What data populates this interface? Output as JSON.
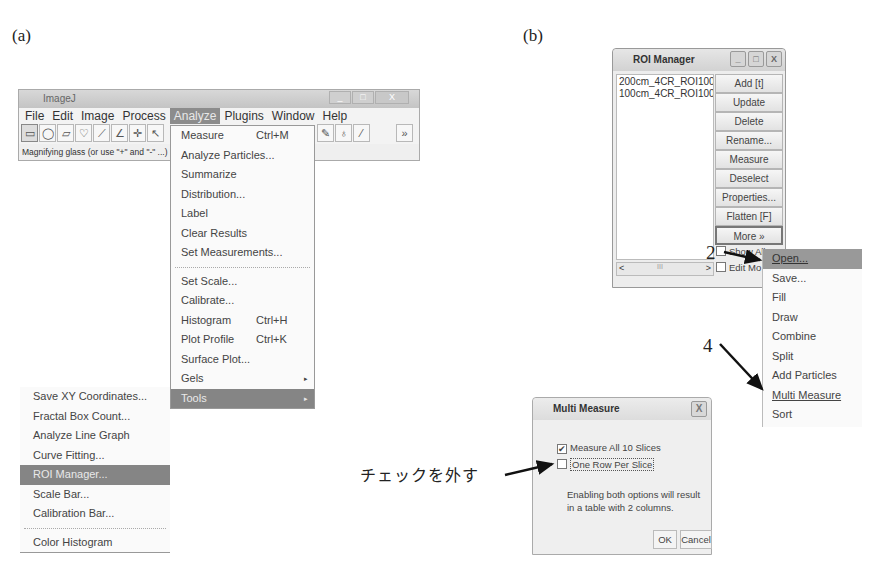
{
  "panels": {
    "a": "(a)",
    "b": "(b)"
  },
  "imagej": {
    "title": "ImageJ",
    "window_controls": [
      "_",
      "□",
      "X"
    ],
    "menubar": [
      "File",
      "Edit",
      "Image",
      "Process",
      "Analyze",
      "Plugins",
      "Window",
      "Help"
    ],
    "active_menu": "Analyze",
    "tools": [
      "rectangle-icon",
      "oval-icon",
      "polygon-icon",
      "freehand-icon",
      "line-icon",
      "angle-icon",
      "point-icon",
      "wand-icon",
      "text-icon",
      "magnifier-icon",
      "hand-icon",
      "dropper-icon",
      "brush-icon",
      "flood-icon",
      "pick-icon",
      "blank",
      "more-icon"
    ],
    "more_tools_label": "»",
    "status": "Magnifying glass (or use \"+\" and \"-\" ...)"
  },
  "analyze_menu": {
    "group1": [
      {
        "label": "Measure",
        "shortcut": "Ctrl+M"
      },
      {
        "label": "Analyze Particles..."
      },
      {
        "label": "Summarize"
      },
      {
        "label": "Distribution..."
      },
      {
        "label": "Label"
      },
      {
        "label": "Clear Results"
      },
      {
        "label": "Set Measurements..."
      }
    ],
    "group2": [
      {
        "label": "Set Scale..."
      },
      {
        "label": "Calibrate..."
      },
      {
        "label": "Histogram",
        "shortcut": "Ctrl+H"
      },
      {
        "label": "Plot Profile",
        "shortcut": "Ctrl+K"
      },
      {
        "label": "Surface Plot..."
      },
      {
        "label": "Gels",
        "submenu": "▸"
      },
      {
        "label": "Tools",
        "submenu": "▸",
        "highlight": true
      }
    ]
  },
  "tools_submenu": {
    "items": [
      {
        "label": "Save XY Coordinates..."
      },
      {
        "label": "Fractal Box Count..."
      },
      {
        "label": "Analyze Line Graph"
      },
      {
        "label": "Curve Fitting..."
      },
      {
        "label": "ROI Manager...",
        "highlight": true
      },
      {
        "label": "Scale Bar..."
      },
      {
        "label": "Calibration Bar..."
      }
    ],
    "after_sep": [
      {
        "label": "Color Histogram"
      }
    ]
  },
  "roi_manager": {
    "title": "ROI Manager",
    "window_controls": [
      "_",
      "□",
      "X"
    ],
    "list": [
      "200cm_4CR_ROI100:",
      "100cm_4CR_ROI100:"
    ],
    "buttons": [
      "Add [t]",
      "Update",
      "Delete",
      "Rename...",
      "Measure",
      "Deselect",
      "Properties...",
      "Flatten [F]",
      "More »"
    ],
    "show_all_label": "Show All",
    "edit_mode_label": "Edit Mo",
    "scroll": {
      "left": "<",
      "right": ">",
      "thumb": "III"
    }
  },
  "more_menu": {
    "items": [
      {
        "label": "Open...",
        "highlight": true,
        "underline": true
      },
      {
        "label": "Save..."
      },
      {
        "label": "Fill"
      },
      {
        "label": "Draw"
      },
      {
        "label": "Combine"
      },
      {
        "label": "Split"
      },
      {
        "label": "Add Particles"
      },
      {
        "label": "Multi Measure",
        "underline": true
      },
      {
        "label": "Sort"
      }
    ]
  },
  "multi_measure": {
    "title": "Multi Measure",
    "close": "X",
    "check1": {
      "label": "Measure All 10 Slices",
      "checked": true,
      "mark": "✔"
    },
    "check2": {
      "label": "One Row Per Slice",
      "checked": false,
      "mark": ""
    },
    "info": "Enabling both options will result in a table with 2 columns.",
    "ok": "OK",
    "cancel": "Cancel"
  },
  "annotations": {
    "step2": "2",
    "step4": "4",
    "uncheck": "チェックを外す"
  }
}
